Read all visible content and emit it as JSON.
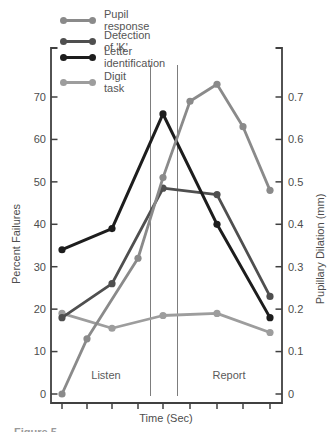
{
  "chart_data": {
    "type": "line",
    "title": "",
    "xlabel": "Time (Sec)",
    "ylabel_left": "Percent Failures",
    "ylabel_right": "Pupillary Dilation (mm)",
    "axes": {
      "left": {
        "min": 0,
        "max": 70,
        "tick_labels": [
          "0",
          "10",
          "20",
          "30",
          "40",
          "50",
          "60",
          "70"
        ],
        "tick_values": [
          0,
          10,
          20,
          30,
          40,
          50,
          60,
          70
        ]
      },
      "right": {
        "min": 0,
        "max": 0.7,
        "tick_labels": [
          "0",
          "0.1",
          "0.2",
          "0.3",
          "0.4",
          "0.5",
          "0.6",
          "0.7"
        ],
        "tick_values": [
          0,
          0.1,
          0.2,
          0.3,
          0.4,
          0.5,
          0.6,
          0.7
        ]
      },
      "x": {
        "tick_count": 9,
        "tick_labels_shown": false
      }
    },
    "phase_labels": [
      {
        "label": "Listen"
      },
      {
        "label": "Report"
      }
    ],
    "phase_divider_x_between_ticks": [
      [
        4,
        5
      ],
      [
        5,
        6
      ]
    ],
    "series": [
      {
        "name": "Pupil response",
        "axis": "right",
        "color": "#8a8a8a",
        "x_tick": [
          1,
          2,
          4,
          5,
          6,
          7,
          8,
          9
        ],
        "values": [
          0,
          0.13,
          0.32,
          0.51,
          0.69,
          0.73,
          0.63,
          0.48
        ]
      },
      {
        "name": "Detection of 'K'",
        "axis": "left",
        "color": "#4f4f4f",
        "x_tick": [
          1,
          3,
          5,
          7,
          9
        ],
        "values": [
          18,
          26,
          48.5,
          47,
          23
        ]
      },
      {
        "name": "Letter identification",
        "axis": "left",
        "color": "#1d1d1d",
        "x_tick": [
          1,
          3,
          5,
          7,
          9
        ],
        "values": [
          34,
          39,
          66,
          40,
          18
        ]
      },
      {
        "name": "Digit task",
        "axis": "left",
        "color": "#9d9d9d",
        "x_tick": [
          1,
          3,
          5,
          7,
          9
        ],
        "values": [
          19,
          15.5,
          18.5,
          19,
          14.5
        ]
      }
    ],
    "colors": {
      "axis": "#404040",
      "tick_text": "#4d4d4d",
      "divider": "#6e6e6e"
    }
  },
  "caption": {
    "partial_text": "Figure 5."
  }
}
